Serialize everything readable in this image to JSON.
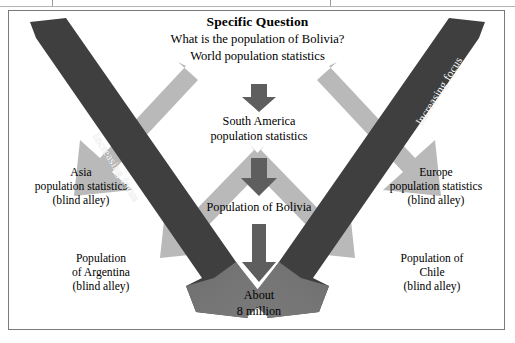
{
  "figure": {
    "title": "Specific Question",
    "question": "What is the population of Bolivia?",
    "root": "World population statistics",
    "center_chain": [
      "South America\npopulation statistics",
      "Population of Bolivia",
      "About\n8 million"
    ],
    "center_nodes": {
      "level1": "South America",
      "level1b": "population statistics",
      "level2": "Population of Bolivia",
      "answer_line1": "About",
      "answer_line2": "8 million"
    },
    "branches": {
      "left_upper": {
        "line1": "Asia",
        "line2": "population statistics",
        "line3": "(blind alley)"
      },
      "left_lower": {
        "line1": "Population",
        "line2": "of Argentina",
        "line3": "(blind alley)"
      },
      "right_upper": {
        "line1": "Europe",
        "line2": "population statistics",
        "line3": "(blind alley)"
      },
      "right_lower": {
        "line1": "Population of",
        "line2": "Chile",
        "line3": "(blind alley)"
      }
    },
    "focus_left_caption": "Increasing focus",
    "focus_right_caption": "Increasing focus",
    "colors": {
      "dark_arrow": "#3f3f3f",
      "mid_arrow": "#5e5e5e",
      "head_arrow": "#6e6e6e",
      "light_arrow": "#b9b9b9",
      "frame": "#7a7a7a",
      "text": "#000000",
      "caption": "#ffffff",
      "background": "#ffffff"
    }
  }
}
